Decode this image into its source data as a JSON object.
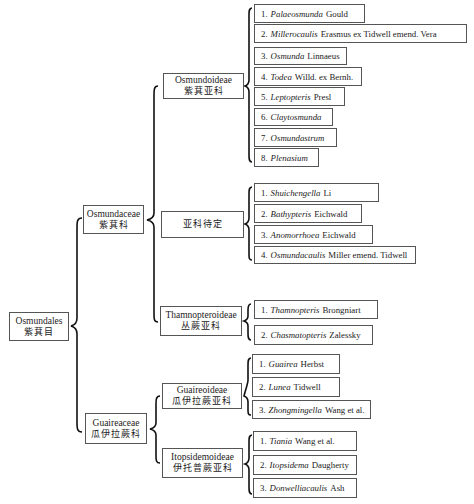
{
  "order": {
    "name": "Osmundales",
    "zh": "紫萁目"
  },
  "families": [
    {
      "name": "Osmundaceae",
      "zh": "紫萁科",
      "subfamilies": [
        {
          "name": "Osmundoideae",
          "zh": "紫萁亚科",
          "genera": [
            {
              "num": "1.",
              "genus": "Palaeosmunda",
              "author": "Gould"
            },
            {
              "num": "2.",
              "genus": "Millerocaulis",
              "author": "Erasmus ex Tidwell emend. Vera"
            },
            {
              "num": "3.",
              "genus": "Osmunda",
              "author": "Linnaeus"
            },
            {
              "num": "4.",
              "genus": "Todea",
              "author": "Willd. ex Bernh."
            },
            {
              "num": "5.",
              "genus": "Leptopteris",
              "author": "Presl"
            },
            {
              "num": "6.",
              "genus": "Claytosmunda",
              "author": ""
            },
            {
              "num": "7.",
              "genus": "Osmundastrum",
              "author": ""
            },
            {
              "num": "8.",
              "genus": "Plenasium",
              "author": ""
            }
          ]
        },
        {
          "name": "",
          "zh": "亚科待定",
          "genera": [
            {
              "num": "1.",
              "genus": "Shuichengella",
              "author": "Li"
            },
            {
              "num": "2.",
              "genus": "Bathypteris",
              "author": "Eichwald"
            },
            {
              "num": "3.",
              "genus": "Anomorrhoea",
              "author": "Eichwald"
            },
            {
              "num": "4.",
              "genus": "Osmundacaulis",
              "author": "Miller emend. Tidwell"
            }
          ]
        },
        {
          "name": "Thamnopteroideae",
          "zh": "丛蕨亚科",
          "genera": [
            {
              "num": "1.",
              "genus": "Thamnopteris",
              "author": "Brongniart"
            },
            {
              "num": "2.",
              "genus": "Chasmatopteris",
              "author": "Zalessky"
            }
          ]
        }
      ]
    },
    {
      "name": "Guaireaceae",
      "zh": "瓜伊拉蕨科",
      "subfamilies": [
        {
          "name": "Guaireoideae",
          "zh": "瓜伊拉蕨亚科",
          "genera": [
            {
              "num": "1.",
              "genus": "Guairea",
              "author": "Herbst"
            },
            {
              "num": "2.",
              "genus": "Lunea",
              "author": "Tidwell"
            },
            {
              "num": "3.",
              "genus": "Zhongmingella",
              "author": "Wang et al."
            }
          ]
        },
        {
          "name": "Itopsidemoideae",
          "zh": "伊托普蕨亚科",
          "genera": [
            {
              "num": "1.",
              "genus": "Tiania",
              "author": "Wang et al."
            },
            {
              "num": "2.",
              "genus": "Itopsidema",
              "author": "Daugherty"
            },
            {
              "num": "3.",
              "genus": "Donwelliacaulis",
              "author": "Ash"
            }
          ]
        }
      ]
    }
  ]
}
